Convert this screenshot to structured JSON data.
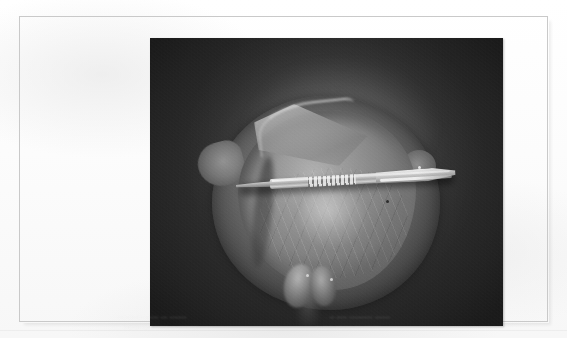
{
  "document": {
    "kind": "scanned-book-page",
    "page_background_color": "#fdfdfd",
    "frame_border_color": "#c9c9c9"
  },
  "figure": {
    "name": "anatomical-specimen-photograph",
    "type": "grayscale-photograph",
    "background_color": "#3b3b3b",
    "specimen_highlight_color": "#b4b4b4",
    "instrument": "scalpel",
    "instrument_label": "surgical scalpel (scale reference)"
  },
  "caption": {
    "line1_left": "..................... .. ..........",
    "line1_right": ".. ..... ........ ... ........",
    "ghost_left": "............ ...... ... ........",
    "ghost_right": ".. ..... ........... .......",
    "legible": false
  }
}
